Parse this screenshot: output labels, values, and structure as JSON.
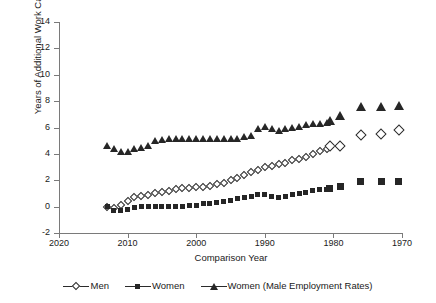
{
  "chart_data": {
    "type": "scatter",
    "title": "",
    "xlabel": "Comparison Year",
    "ylabel": "Years of Additional Work Capacity",
    "xlim": [
      2020,
      1970
    ],
    "ylim": [
      -2,
      14
    ],
    "x_ticks": [
      2020,
      2010,
      2000,
      1990,
      1980,
      1970
    ],
    "y_ticks": [
      -2,
      0,
      2,
      4,
      6,
      8,
      10,
      12,
      14
    ],
    "x_axis_reversed": true,
    "grid": false,
    "legend_position": "bottom",
    "series": [
      {
        "name": "Men",
        "marker": "open-diamond",
        "color": "#2b2b2b",
        "points": [
          {
            "x": 2013,
            "y": 0.0
          },
          {
            "x": 2012,
            "y": -0.1
          },
          {
            "x": 2011,
            "y": 0.1
          },
          {
            "x": 2010,
            "y": 0.4
          },
          {
            "x": 2009,
            "y": 0.7
          },
          {
            "x": 2008,
            "y": 0.8
          },
          {
            "x": 2007,
            "y": 0.9
          },
          {
            "x": 2006,
            "y": 1.0
          },
          {
            "x": 2005,
            "y": 1.1
          },
          {
            "x": 2004,
            "y": 1.2
          },
          {
            "x": 2003,
            "y": 1.3
          },
          {
            "x": 2002,
            "y": 1.4
          },
          {
            "x": 2001,
            "y": 1.4
          },
          {
            "x": 2000,
            "y": 1.5
          },
          {
            "x": 1999,
            "y": 1.5
          },
          {
            "x": 1998,
            "y": 1.6
          },
          {
            "x": 1997,
            "y": 1.7
          },
          {
            "x": 1996,
            "y": 1.8
          },
          {
            "x": 1995,
            "y": 2.0
          },
          {
            "x": 1994,
            "y": 2.2
          },
          {
            "x": 1993,
            "y": 2.4
          },
          {
            "x": 1992,
            "y": 2.6
          },
          {
            "x": 1991,
            "y": 2.8
          },
          {
            "x": 1990,
            "y": 3.0
          },
          {
            "x": 1989,
            "y": 3.1
          },
          {
            "x": 1988,
            "y": 3.2
          },
          {
            "x": 1987,
            "y": 3.3
          },
          {
            "x": 1986,
            "y": 3.5
          },
          {
            "x": 1985,
            "y": 3.6
          },
          {
            "x": 1984,
            "y": 3.8
          },
          {
            "x": 1983,
            "y": 4.0
          },
          {
            "x": 1982,
            "y": 4.2
          },
          {
            "x": 1981,
            "y": 4.4
          },
          {
            "x": 1980.5,
            "y": 4.6
          },
          {
            "x": 1979,
            "y": 4.6
          },
          {
            "x": 1976,
            "y": 5.4
          },
          {
            "x": 1973,
            "y": 5.5
          },
          {
            "x": 1970.5,
            "y": 5.8
          }
        ]
      },
      {
        "name": "Women",
        "marker": "filled-square",
        "color": "#262626",
        "points": [
          {
            "x": 2013,
            "y": 0.0
          },
          {
            "x": 2012,
            "y": -0.3
          },
          {
            "x": 2011,
            "y": -0.3
          },
          {
            "x": 2010,
            "y": -0.2
          },
          {
            "x": 2009,
            "y": -0.1
          },
          {
            "x": 2008,
            "y": 0.0
          },
          {
            "x": 2007,
            "y": 0.0
          },
          {
            "x": 2006,
            "y": 0.0
          },
          {
            "x": 2005,
            "y": 0.0
          },
          {
            "x": 2004,
            "y": 0.0
          },
          {
            "x": 2003,
            "y": 0.0
          },
          {
            "x": 2002,
            "y": 0.0
          },
          {
            "x": 2001,
            "y": 0.1
          },
          {
            "x": 2000,
            "y": 0.1
          },
          {
            "x": 1999,
            "y": 0.2
          },
          {
            "x": 1998,
            "y": 0.2
          },
          {
            "x": 1997,
            "y": 0.3
          },
          {
            "x": 1996,
            "y": 0.4
          },
          {
            "x": 1995,
            "y": 0.5
          },
          {
            "x": 1994,
            "y": 0.6
          },
          {
            "x": 1993,
            "y": 0.7
          },
          {
            "x": 1992,
            "y": 0.8
          },
          {
            "x": 1991,
            "y": 0.9
          },
          {
            "x": 1990,
            "y": 0.9
          },
          {
            "x": 1989,
            "y": 0.8
          },
          {
            "x": 1988,
            "y": 0.7
          },
          {
            "x": 1987,
            "y": 0.8
          },
          {
            "x": 1986,
            "y": 0.9
          },
          {
            "x": 1985,
            "y": 1.0
          },
          {
            "x": 1984,
            "y": 1.1
          },
          {
            "x": 1983,
            "y": 1.2
          },
          {
            "x": 1982,
            "y": 1.3
          },
          {
            "x": 1981,
            "y": 1.3
          },
          {
            "x": 1980.5,
            "y": 1.4
          },
          {
            "x": 1979,
            "y": 1.5
          },
          {
            "x": 1976,
            "y": 1.9
          },
          {
            "x": 1973,
            "y": 1.9
          },
          {
            "x": 1970.5,
            "y": 1.9
          }
        ]
      },
      {
        "name": "Women (Male Employment Rates)",
        "marker": "filled-triangle",
        "color": "#262626",
        "points": [
          {
            "x": 2013,
            "y": 4.6
          },
          {
            "x": 2012,
            "y": 4.4
          },
          {
            "x": 2011,
            "y": 4.2
          },
          {
            "x": 2010,
            "y": 4.2
          },
          {
            "x": 2009,
            "y": 4.4
          },
          {
            "x": 2008,
            "y": 4.5
          },
          {
            "x": 2007,
            "y": 4.6
          },
          {
            "x": 2006,
            "y": 5.0
          },
          {
            "x": 2005,
            "y": 5.1
          },
          {
            "x": 2004,
            "y": 5.2
          },
          {
            "x": 2003,
            "y": 5.2
          },
          {
            "x": 2002,
            "y": 5.2
          },
          {
            "x": 2001,
            "y": 5.2
          },
          {
            "x": 2000,
            "y": 5.2
          },
          {
            "x": 1999,
            "y": 5.2
          },
          {
            "x": 1998,
            "y": 5.2
          },
          {
            "x": 1997,
            "y": 5.2
          },
          {
            "x": 1996,
            "y": 5.2
          },
          {
            "x": 1995,
            "y": 5.2
          },
          {
            "x": 1994,
            "y": 5.2
          },
          {
            "x": 1993,
            "y": 5.3
          },
          {
            "x": 1992,
            "y": 5.4
          },
          {
            "x": 1991,
            "y": 5.9
          },
          {
            "x": 1990,
            "y": 6.1
          },
          {
            "x": 1989,
            "y": 5.9
          },
          {
            "x": 1988,
            "y": 5.8
          },
          {
            "x": 1987,
            "y": 5.9
          },
          {
            "x": 1986,
            "y": 6.0
          },
          {
            "x": 1985,
            "y": 6.1
          },
          {
            "x": 1984,
            "y": 6.2
          },
          {
            "x": 1983,
            "y": 6.3
          },
          {
            "x": 1982,
            "y": 6.3
          },
          {
            "x": 1981,
            "y": 6.4
          },
          {
            "x": 1980.5,
            "y": 6.5
          },
          {
            "x": 1979,
            "y": 6.9
          },
          {
            "x": 1976,
            "y": 7.6
          },
          {
            "x": 1973,
            "y": 7.6
          },
          {
            "x": 1970.5,
            "y": 7.7
          }
        ]
      }
    ]
  },
  "legend": {
    "items": [
      {
        "label": "Men",
        "marker": "open-diamond"
      },
      {
        "label": "Women",
        "marker": "filled-square"
      },
      {
        "label": "Women (Male Employment Rates)",
        "marker": "filled-triangle"
      }
    ]
  }
}
